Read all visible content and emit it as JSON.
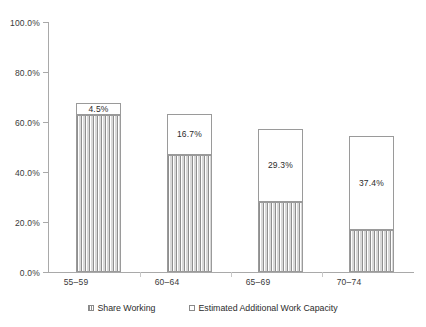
{
  "chart_data": {
    "type": "bar",
    "subtype": "stacked-bar",
    "title": "",
    "xlabel": "",
    "ylabel": "",
    "categories": [
      "55–59",
      "60–64",
      "65–69",
      "70–74"
    ],
    "series": [
      {
        "name": "Share Working",
        "values": [
          63.0,
          46.7,
          28.0,
          17.0
        ],
        "fill": "vertical-hatch",
        "labels_shown": false
      },
      {
        "name": "Estimated Additional Work Capacity",
        "values": [
          4.5,
          16.7,
          29.3,
          37.4
        ],
        "fill": "white",
        "labels_shown": true,
        "data_labels": [
          "4.5%",
          "16.7%",
          "29.3%",
          "37.4%"
        ]
      }
    ],
    "totals": [
      67.5,
      63.4,
      57.3,
      54.4
    ],
    "ylim": [
      0,
      100
    ],
    "y_ticks": [
      0,
      20,
      40,
      60,
      80,
      100
    ],
    "y_tick_labels": [
      "0.0%",
      "20.0%",
      "40.0%",
      "60.0%",
      "80.0%",
      "100.0%"
    ],
    "grid": false,
    "legend_position": "bottom",
    "axis_color": "#a9a9a9"
  },
  "axis": {
    "y_labels": [
      "100.0%",
      "80.0%",
      "60.0%",
      "40.0%",
      "20.0%",
      "0.0%"
    ],
    "x_labels": [
      "55–59",
      "60–64",
      "65–69",
      "70–74"
    ]
  },
  "bars": [
    {
      "category": "55–59",
      "working": 63.0,
      "capacity": 4.5,
      "capacity_label": "4.5%"
    },
    {
      "category": "60–64",
      "working": 46.7,
      "capacity": 16.7,
      "capacity_label": "16.7%"
    },
    {
      "category": "65–69",
      "working": 28.0,
      "capacity": 29.3,
      "capacity_label": "29.3%"
    },
    {
      "category": "70–74",
      "working": 17.0,
      "capacity": 37.4,
      "capacity_label": "37.4%"
    }
  ],
  "legend": {
    "items": [
      {
        "label": "Share Working"
      },
      {
        "label": "Estimated Additional Work Capacity"
      }
    ]
  }
}
